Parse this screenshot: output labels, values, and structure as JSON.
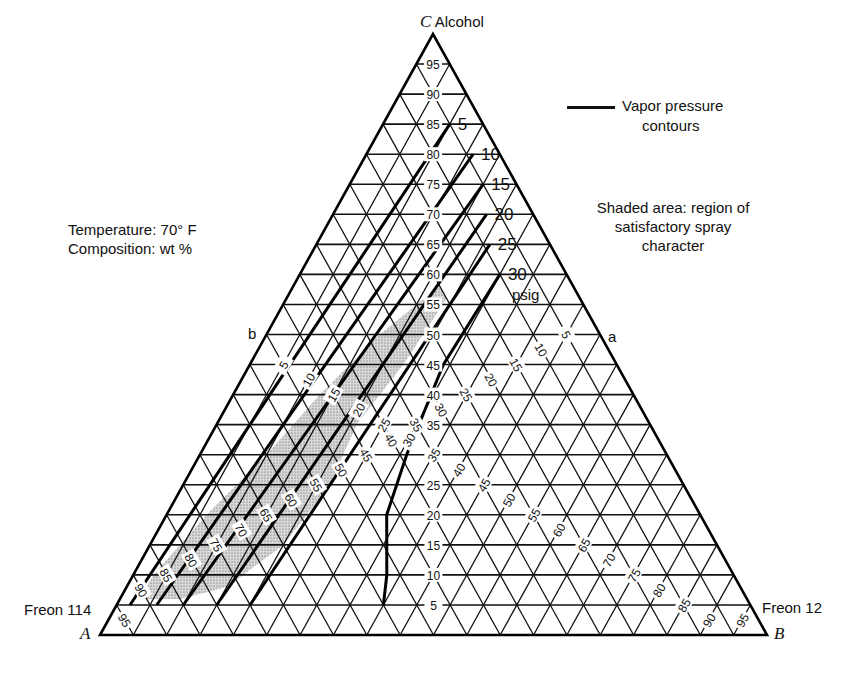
{
  "chart_data": {
    "type": "ternary",
    "title": "",
    "vertices": {
      "A": {
        "letter": "A",
        "label": "Freon 114"
      },
      "B": {
        "letter": "B",
        "label": "Freon 12"
      },
      "C": {
        "letter": "C",
        "label": "Alcohol"
      }
    },
    "conditions": [
      "Temperature: 70° F",
      "Composition: wt %"
    ],
    "grid": {
      "step": 5,
      "min": 5,
      "max": 95
    },
    "axis_ticks": {
      "C_alcohol": [
        5,
        10,
        15,
        20,
        25,
        30,
        35,
        40,
        45,
        50,
        55,
        60,
        65,
        70,
        75,
        80,
        85,
        90,
        95
      ],
      "A_freon114": [
        5,
        10,
        15,
        20,
        25,
        30,
        35,
        40,
        45,
        50,
        55,
        60,
        65,
        70,
        75,
        80,
        85,
        90,
        95
      ],
      "B_freon12": [
        5,
        10,
        15,
        20,
        25,
        30,
        35,
        40,
        45,
        50,
        55,
        60,
        65,
        70,
        75,
        80,
        85,
        90,
        95
      ]
    },
    "legend": {
      "line_label_1": "Vapor pressure",
      "line_label_2": "contours",
      "shaded_1": "Shaded area: region of",
      "shaded_2": "satisfactory spray",
      "shaded_3": "character"
    },
    "contour_unit": "psig",
    "contours": [
      {
        "psig": 5,
        "points_C_B": [
          [
            5,
            2
          ],
          [
            85,
            10
          ]
        ]
      },
      {
        "psig": 10,
        "points_C_B": [
          [
            5,
            6
          ],
          [
            80,
            16
          ]
        ]
      },
      {
        "psig": 15,
        "points_C_B": [
          [
            5,
            10
          ],
          [
            75,
            20
          ]
        ]
      },
      {
        "psig": 20,
        "points_C_B": [
          [
            5,
            15
          ],
          [
            70,
            23
          ]
        ]
      },
      {
        "psig": 25,
        "points_C_B": [
          [
            5,
            20
          ],
          [
            65,
            26
          ]
        ]
      },
      {
        "psig": 30,
        "points_C_B": [
          [
            5,
            40
          ],
          [
            10,
            38
          ],
          [
            20,
            33
          ],
          [
            30,
            31
          ],
          [
            45,
            29
          ],
          [
            60,
            30
          ]
        ]
      }
    ],
    "shaded_region_C_B": [
      [
        6,
        3
      ],
      [
        10,
        3
      ],
      [
        20,
        6
      ],
      [
        30,
        10
      ],
      [
        40,
        13
      ],
      [
        50,
        17
      ],
      [
        55,
        20
      ],
      [
        58,
        22
      ],
      [
        56,
        24
      ],
      [
        45,
        23
      ],
      [
        35,
        21
      ],
      [
        25,
        22
      ],
      [
        15,
        20
      ],
      [
        8,
        15
      ],
      [
        6,
        9
      ]
    ],
    "markers": {
      "a": "a",
      "b": "b"
    },
    "boundary_line_a_b_C": 50
  }
}
